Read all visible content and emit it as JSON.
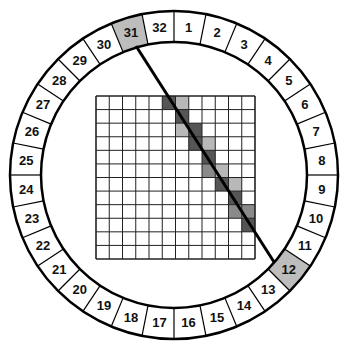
{
  "diagram": {
    "ring": {
      "segment_count": 32,
      "labels": [
        "1",
        "2",
        "3",
        "4",
        "5",
        "6",
        "7",
        "8",
        "9",
        "10",
        "11",
        "12",
        "13",
        "14",
        "15",
        "16",
        "17",
        "18",
        "19",
        "20",
        "21",
        "22",
        "23",
        "24",
        "25",
        "26",
        "27",
        "28",
        "29",
        "30",
        "31",
        "32"
      ],
      "highlighted_segments": [
        31,
        12
      ],
      "highlight_color": "#bdbdbd"
    },
    "grid": {
      "rows": 12,
      "cols": 12,
      "shaded_cells": [
        {
          "row": 0,
          "col": 5,
          "shade": "dark"
        },
        {
          "row": 0,
          "col": 6,
          "shade": "light"
        },
        {
          "row": 1,
          "col": 6,
          "shade": "dark"
        },
        {
          "row": 2,
          "col": 6,
          "shade": "light"
        },
        {
          "row": 2,
          "col": 7,
          "shade": "dark"
        },
        {
          "row": 3,
          "col": 7,
          "shade": "dark"
        },
        {
          "row": 3,
          "col": 8,
          "shade": "light"
        },
        {
          "row": 4,
          "col": 8,
          "shade": "dark"
        },
        {
          "row": 5,
          "col": 8,
          "shade": "medium"
        },
        {
          "row": 5,
          "col": 9,
          "shade": "light"
        },
        {
          "row": 6,
          "col": 9,
          "shade": "dark"
        },
        {
          "row": 6,
          "col": 10,
          "shade": "light"
        },
        {
          "row": 7,
          "col": 10,
          "shade": "dark"
        },
        {
          "row": 8,
          "col": 10,
          "shade": "medium"
        },
        {
          "row": 8,
          "col": 11,
          "shade": "medium"
        },
        {
          "row": 9,
          "col": 11,
          "shade": "dark"
        }
      ],
      "shade_colors": {
        "dark": "#555555",
        "medium": "#8a8a8a",
        "light": "#b8b8b8"
      }
    },
    "ray": {
      "from_segment": "31",
      "to_segment": "12"
    }
  }
}
